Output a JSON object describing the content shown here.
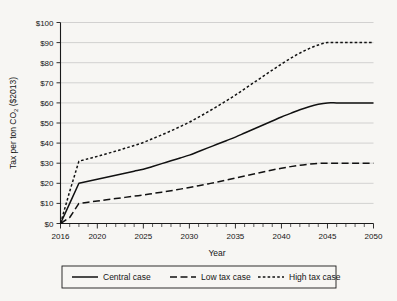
{
  "chart_data": {
    "type": "line",
    "title": "",
    "xlabel": "Year",
    "ylabel": "Tax per ton CO2 ($2013)",
    "ylabel_prefix": "Tax per ton CO",
    "ylabel_subscript": "2",
    "ylabel_suffix": " ($2013)",
    "xlim": [
      2016,
      2050
    ],
    "ylim": [
      0,
      100
    ],
    "grid": "horizontal",
    "legend_position": "bottom",
    "x_tick_labels": [
      "2016",
      "2020",
      "2025",
      "2030",
      "2035",
      "2040",
      "2045",
      "2050"
    ],
    "x_tick_values": [
      2016,
      2020,
      2025,
      2030,
      2035,
      2040,
      2045,
      2050
    ],
    "x_minor_tick_step": 1,
    "y_tick_labels": [
      "$0",
      "$10",
      "$20",
      "$30",
      "$40",
      "$50",
      "$60",
      "$70",
      "$80",
      "$90",
      "$100"
    ],
    "y_tick_values": [
      0,
      10,
      20,
      30,
      40,
      50,
      60,
      70,
      80,
      90,
      100
    ],
    "x": [
      2016,
      2017,
      2018,
      2019,
      2020,
      2021,
      2022,
      2023,
      2024,
      2025,
      2026,
      2027,
      2028,
      2029,
      2030,
      2031,
      2032,
      2033,
      2034,
      2035,
      2036,
      2037,
      2038,
      2039,
      2040,
      2041,
      2042,
      2043,
      2044,
      2045,
      2046,
      2047,
      2048,
      2049,
      2050
    ],
    "series": [
      {
        "name": "Central case",
        "style": "solid",
        "color": "#111111",
        "values": [
          0,
          10,
          20,
          21,
          22,
          23,
          24,
          25,
          26,
          27,
          28.4,
          29.8,
          31.2,
          32.6,
          34,
          35.8,
          37.6,
          39.4,
          41.2,
          43,
          45,
          47,
          49,
          51,
          53,
          54.8,
          56.6,
          58.1,
          59.3,
          60,
          60,
          60,
          60,
          60,
          60
        ]
      },
      {
        "name": "Low tax case",
        "style": "dashed",
        "color": "#111111",
        "values": [
          0,
          3,
          10,
          10.6,
          11.2,
          11.8,
          12.4,
          13,
          13.6,
          14.2,
          14.9,
          15.6,
          16.3,
          17.1,
          17.9,
          18.8,
          19.7,
          20.6,
          21.6,
          22.6,
          23.6,
          24.6,
          25.6,
          26.6,
          27.5,
          28.3,
          29,
          29.5,
          29.9,
          30,
          30,
          30,
          30,
          30,
          30
        ]
      },
      {
        "name": "High tax case",
        "style": "dotted",
        "color": "#111111",
        "values": [
          0,
          16,
          31,
          32.2,
          33.4,
          34.7,
          36,
          37.4,
          38.8,
          40.3,
          42.2,
          44.1,
          46.1,
          48.2,
          50.4,
          52.9,
          55.5,
          58.2,
          61,
          63.9,
          67,
          70.1,
          73.2,
          76.3,
          79.3,
          82.2,
          84.8,
          87,
          88.8,
          90,
          90,
          90,
          90,
          90,
          90
        ]
      }
    ],
    "legend": [
      {
        "label": "Central case",
        "style": "solid"
      },
      {
        "label": "Low tax case",
        "style": "dashed"
      },
      {
        "label": "High tax case",
        "style": "dotted"
      }
    ]
  }
}
